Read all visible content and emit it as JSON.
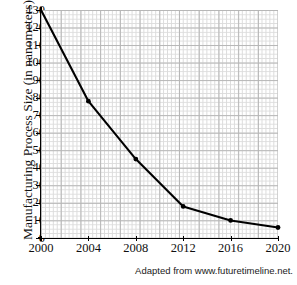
{
  "chart_data": {
    "type": "line",
    "title": "",
    "xlabel": "",
    "ylabel": "Manufacturing Process Size (in nanometers)",
    "x": [
      2000,
      2004,
      2008,
      2012,
      2016,
      2020
    ],
    "values": [
      130,
      78,
      45,
      18,
      10,
      6
    ],
    "series": [
      {
        "name": "Manufacturing Process Size",
        "values": [
          130,
          78,
          45,
          18,
          10,
          6
        ]
      }
    ],
    "xlim": [
      2000,
      2020
    ],
    "ylim": [
      0,
      130
    ],
    "xticks": [
      "2000",
      "2004",
      "2008",
      "2012",
      "2016",
      "2020"
    ],
    "yticks": [
      "0",
      "10",
      "20",
      "30",
      "40",
      "50",
      "60",
      "70",
      "80",
      "90",
      "100",
      "110",
      "120",
      "130"
    ],
    "grid": true,
    "legend": false,
    "marker": "dot",
    "line_color": "#000000",
    "grid_color_minor": "#dcdcdc",
    "grid_color_major": "#b6b6b6",
    "background": "#ffffff"
  },
  "caption": {
    "text": "Adapted from www.futuretimeline.net."
  }
}
